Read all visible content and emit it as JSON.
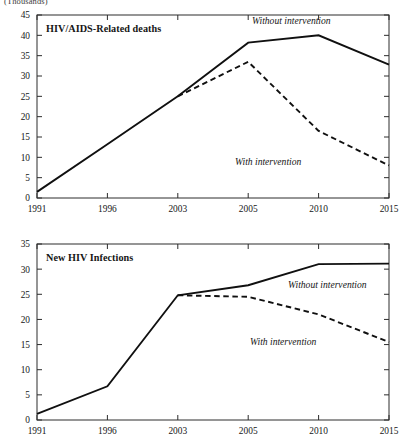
{
  "figure": {
    "unit_caption": "(Thousands)"
  },
  "chart_data": [
    {
      "type": "line",
      "title": "HIV/AIDS-Related deaths",
      "xlabel": "",
      "ylabel": "(Thousands)",
      "x": [
        "1991",
        "1996",
        "2003",
        "2005",
        "2010",
        "2015"
      ],
      "xtick_labels": [
        "1991",
        "1996",
        "2003",
        "2005",
        "2010",
        "2015"
      ],
      "ytick_labels": [
        "0",
        "5",
        "10",
        "15",
        "20",
        "25",
        "30",
        "35",
        "40",
        "45"
      ],
      "ylim": [
        0,
        45
      ],
      "ystep": 5,
      "grid": false,
      "legend_position": "inline-annotation",
      "series": [
        {
          "name": "Without intervention",
          "style": "solid",
          "values": [
            1.5,
            13.2,
            25.0,
            38.2,
            40.0,
            32.8
          ]
        },
        {
          "name": "With intervention",
          "style": "dashed",
          "values": [
            null,
            null,
            25.0,
            33.5,
            16.5,
            8.0
          ]
        }
      ],
      "annotations": [
        {
          "text": "Without intervention",
          "series": "Without intervention"
        },
        {
          "text": "With intervention",
          "series": "With intervention"
        }
      ]
    },
    {
      "type": "line",
      "title": "New HIV Infections",
      "xlabel": "",
      "ylabel": "(Thousands)",
      "x": [
        "1991",
        "1996",
        "2003",
        "2005",
        "2010",
        "2015"
      ],
      "xtick_labels": [
        "1991",
        "1996",
        "2003",
        "2005",
        "2010",
        "2015"
      ],
      "ytick_labels": [
        "0",
        "5",
        "10",
        "15",
        "20",
        "25",
        "30",
        "35"
      ],
      "ylim": [
        0,
        35
      ],
      "ystep": 5,
      "grid": false,
      "legend_position": "inline-annotation",
      "series": [
        {
          "name": "Without intervention",
          "style": "solid",
          "values": [
            1.2,
            6.7,
            24.8,
            26.8,
            31.0,
            31.1
          ]
        },
        {
          "name": "With intervention",
          "style": "dashed",
          "values": [
            null,
            null,
            24.8,
            24.5,
            21.0,
            15.5
          ]
        }
      ],
      "annotations": [
        {
          "text": "Without intervention",
          "series": "Without intervention"
        },
        {
          "text": "With intervention",
          "series": "With intervention"
        }
      ]
    }
  ]
}
